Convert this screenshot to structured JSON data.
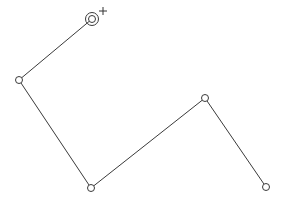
{
  "canvas": {
    "background": "#ffffff",
    "stroke_color": "#3a3a3a",
    "polyline": {
      "points": [
        {
          "x": 92,
          "y": 19,
          "selected": true
        },
        {
          "x": 19,
          "y": 80,
          "selected": false
        },
        {
          "x": 91,
          "y": 188,
          "selected": false
        },
        {
          "x": 205,
          "y": 98,
          "selected": false
        },
        {
          "x": 266,
          "y": 187,
          "selected": false
        }
      ]
    },
    "cursor": {
      "icon": "crosshair-cursor-icon",
      "x": 103,
      "y": 11
    }
  }
}
